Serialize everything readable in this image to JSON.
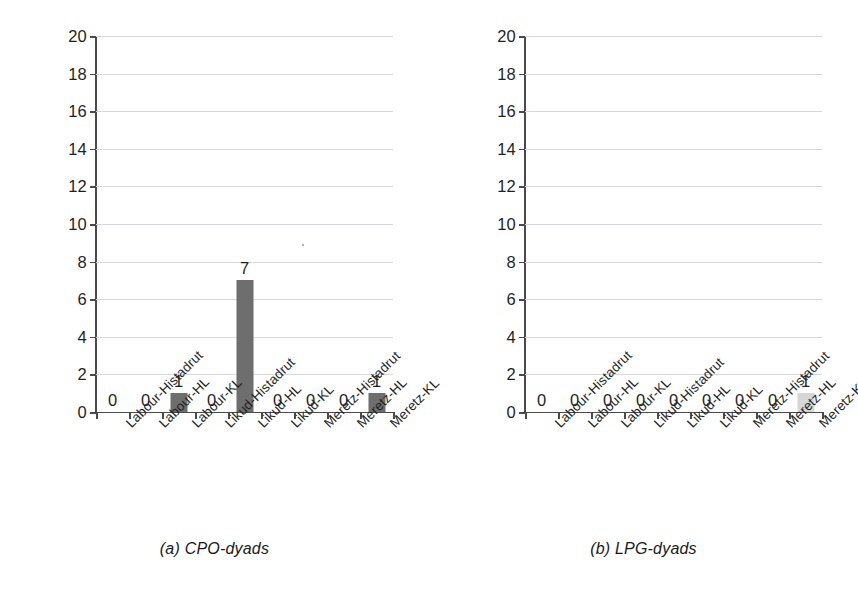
{
  "figure": {
    "title": "",
    "background": "#ffffff",
    "bar_color_dark": "#6e6e6e",
    "bar_color_light": "#d6d6d6",
    "gridline_color": "#d8d8dc",
    "axis_color": "#4a4a4a"
  },
  "panels": [
    {
      "id": "a",
      "caption": "(a) CPO-dyads"
    },
    {
      "id": "b",
      "caption": "(b) LPG-dyads"
    }
  ],
  "yticks": [
    "0",
    "2",
    "4",
    "6",
    "8",
    "10",
    "12",
    "14",
    "16",
    "18",
    "20"
  ],
  "categories": [
    "Labour-Histadrut",
    "Labour-HL",
    "Labour-KL",
    "Likud-Histadrut",
    "Likud-HL",
    "Likud-KL",
    "Meretz-Histadrut",
    "Meretz-HL",
    "Meretz-KL"
  ],
  "chart_data": [
    {
      "type": "bar",
      "title": "(a) CPO-dyads",
      "xlabel": "",
      "ylabel": "",
      "ylim": [
        0,
        20
      ],
      "ytick_step": 2,
      "grid": true,
      "legend": "none",
      "categories": [
        "Labour-Histadrut",
        "Labour-HL",
        "Labour-KL",
        "Likud-Histadrut",
        "Likud-HL",
        "Likud-KL",
        "Meretz-Histadrut",
        "Meretz-HL",
        "Meretz-KL"
      ],
      "values": [
        0,
        0,
        1,
        0,
        7,
        0,
        0,
        0,
        1
      ],
      "value_labels": [
        "0",
        "0",
        "1",
        "0",
        "7",
        "0",
        "0",
        "0",
        "1"
      ],
      "bar_colors": [
        "#6e6e6e",
        "#6e6e6e",
        "#6e6e6e",
        "#6e6e6e",
        "#6e6e6e",
        "#6e6e6e",
        "#6e6e6e",
        "#6e6e6e",
        "#6e6e6e"
      ]
    },
    {
      "type": "bar",
      "title": "(b) LPG-dyads",
      "xlabel": "",
      "ylabel": "",
      "ylim": [
        0,
        20
      ],
      "ytick_step": 2,
      "grid": true,
      "legend": "none",
      "categories": [
        "Labour-Histadrut",
        "Labour-HL",
        "Labour-KL",
        "Likud-Histadrut",
        "Likud-HL",
        "Likud-KL",
        "Meretz-Histadrut",
        "Meretz-HL",
        "Meretz-KL"
      ],
      "values": [
        0,
        0,
        0,
        0,
        0,
        0,
        0,
        0,
        1
      ],
      "value_labels": [
        "0",
        "0",
        "0",
        "0",
        "0",
        "0",
        "0",
        "0",
        "1"
      ],
      "bar_colors": [
        "#6e6e6e",
        "#6e6e6e",
        "#6e6e6e",
        "#6e6e6e",
        "#6e6e6e",
        "#6e6e6e",
        "#6e6e6e",
        "#6e6e6e",
        "#d6d6d6"
      ]
    }
  ]
}
